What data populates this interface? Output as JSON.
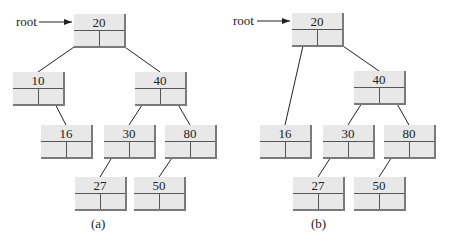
{
  "diagrams": [
    {
      "caption": "(a)",
      "root_label": "root",
      "nodes": [
        {
          "id": "a20",
          "value": "20",
          "x": 74,
          "y": 14
        },
        {
          "id": "a10",
          "value": "10",
          "x": 13,
          "y": 72
        },
        {
          "id": "a40",
          "value": "40",
          "x": 135,
          "y": 72
        },
        {
          "id": "a16",
          "value": "16",
          "x": 41,
          "y": 125
        },
        {
          "id": "a30",
          "value": "30",
          "x": 104,
          "y": 125
        },
        {
          "id": "a80",
          "value": "80",
          "x": 165,
          "y": 125
        },
        {
          "id": "a27",
          "value": "27",
          "x": 75,
          "y": 177
        },
        {
          "id": "a50",
          "value": "50",
          "x": 134,
          "y": 177
        }
      ],
      "edges": [
        [
          "a20",
          "a10",
          "left"
        ],
        [
          "a20",
          "a40",
          "right"
        ],
        [
          "a10",
          "a16",
          "right"
        ],
        [
          "a40",
          "a30",
          "left"
        ],
        [
          "a40",
          "a80",
          "right"
        ],
        [
          "a30",
          "a27",
          "left"
        ],
        [
          "a80",
          "a50",
          "left"
        ]
      ]
    },
    {
      "caption": "(b)",
      "root_label": "root",
      "nodes": [
        {
          "id": "b20",
          "value": "20",
          "x": 292,
          "y": 13
        },
        {
          "id": "b40",
          "value": "40",
          "x": 354,
          "y": 71
        },
        {
          "id": "b16",
          "value": "16",
          "x": 260,
          "y": 125
        },
        {
          "id": "b30",
          "value": "30",
          "x": 323,
          "y": 125
        },
        {
          "id": "b80",
          "value": "80",
          "x": 384,
          "y": 125
        },
        {
          "id": "b27",
          "value": "27",
          "x": 293,
          "y": 177
        },
        {
          "id": "b50",
          "value": "50",
          "x": 354,
          "y": 177
        }
      ],
      "edges": [
        [
          "b20",
          "b16",
          "left"
        ],
        [
          "b20",
          "b40",
          "right"
        ],
        [
          "b40",
          "b30",
          "left"
        ],
        [
          "b40",
          "b80",
          "right"
        ],
        [
          "b30",
          "b27",
          "left"
        ],
        [
          "b80",
          "b50",
          "left"
        ]
      ]
    }
  ]
}
